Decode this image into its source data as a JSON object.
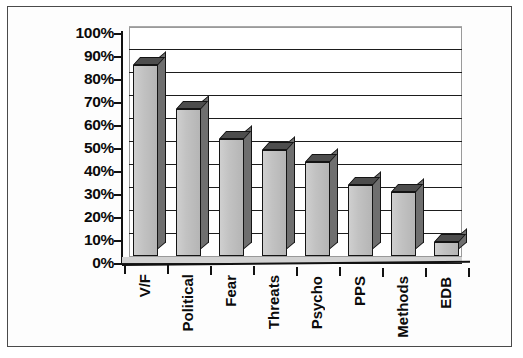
{
  "chart_data": {
    "type": "bar",
    "title": "",
    "subtitle": "",
    "xlabel": "",
    "ylabel": "",
    "categories": [
      "V/F",
      "Political",
      "Fear",
      "Threats",
      "Psycho",
      "PPS",
      "Methods",
      "EDB"
    ],
    "values": [
      83,
      64,
      51,
      46,
      41,
      31,
      28,
      6
    ],
    "value_suffix": "%",
    "ylim": [
      0,
      100
    ],
    "ytick_values": [
      0,
      10,
      20,
      30,
      40,
      50,
      60,
      70,
      80,
      90,
      100
    ],
    "ytick_labels": [
      "0%",
      "10%",
      "20%",
      "30%",
      "40%",
      "50%",
      "60%",
      "70%",
      "80%",
      "90%",
      "100%"
    ],
    "grid": true,
    "grid_axis": "y",
    "legend": false,
    "legend_position": "none",
    "series": [
      {
        "name": "",
        "values": [
          83,
          64,
          51,
          46,
          41,
          31,
          28,
          6
        ]
      }
    ],
    "style": {
      "bar_face_color": "#c2c2c2",
      "bar_edge_color": "#141414",
      "bar_top_color": "#4d4d4d",
      "bar_side_color": "#6f6f6f",
      "gridline_color": "#1d1d1d",
      "axis_color": "#111111",
      "plot_background": "#ffffff",
      "page_background": "#ffffff",
      "frame_color": "#4a4a4a",
      "three_d": true
    }
  }
}
